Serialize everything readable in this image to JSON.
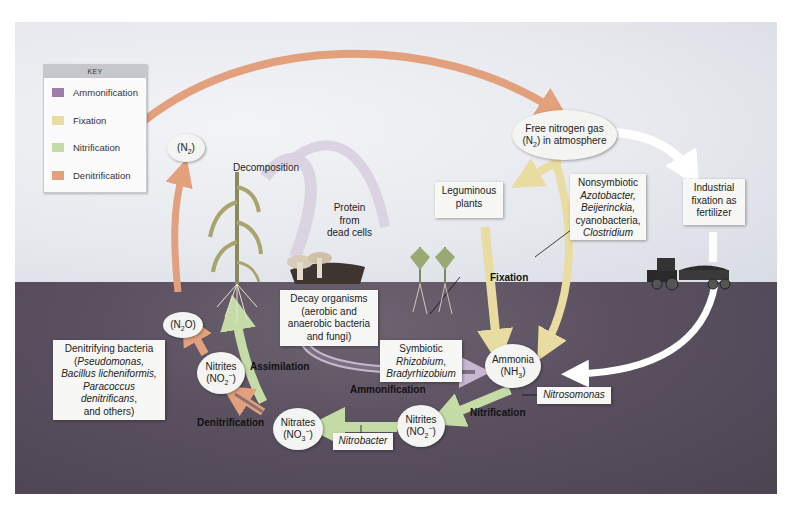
{
  "key": {
    "title": "KEY",
    "items": [
      {
        "label": "Ammonification",
        "color": "#9b7fa8"
      },
      {
        "label": "Fixation",
        "color": "#e8dca0"
      },
      {
        "label": "Nitrification",
        "color": "#c6dca6"
      },
      {
        "label": "Denitrification",
        "color": "#e2a07c"
      }
    ]
  },
  "colors": {
    "ammonification": "#9b7fa8",
    "fixation": "#e8dca0",
    "nitrification": "#c6dca6",
    "denitrification": "#e2a07c",
    "industrial": "#ffffff",
    "sky": "#e6e9ee",
    "soil": "#5a5060"
  },
  "nodes": {
    "n2_left": {
      "prefix": "(N",
      "sub": "2",
      "suffix": ")"
    },
    "n2o": {
      "prefix": "(N",
      "sub": "2",
      "suffix": "O)"
    },
    "free_n2": {
      "line1": "Free nitrogen gas",
      "line2_prefix": "(N",
      "line2_sub": "2",
      "line2_suffix": ") in atmosphere"
    },
    "ammonia": {
      "line1": "Ammonia",
      "line2_prefix": "(NH",
      "line2_sub": "3",
      "line2_suffix": ")"
    },
    "nitrites_upper": {
      "line1": "Nitrites",
      "line2_prefix": "(NO",
      "line2_sub": "2",
      "line2_sup": "−",
      "line2_suffix": ")"
    },
    "nitrites_lower": {
      "line1": "Nitrites",
      "line2_prefix": "(NO",
      "line2_sub": "2",
      "line2_sup": "−",
      "line2_suffix": ")"
    },
    "nitrates": {
      "line1": "Nitrates",
      "line2_prefix": "(NO",
      "line2_sub": "3",
      "line2_sup": "−",
      "line2_suffix": ")"
    }
  },
  "labels": {
    "decomposition": "Decomposition",
    "protein": [
      "Protein",
      "from",
      "dead cells"
    ],
    "leguminous": [
      "Leguminous",
      "plants"
    ],
    "nonsymbiotic": {
      "line1": "Nonsymbiotic",
      "line2": "Azotobacter,",
      "line3": "Beijerinckia,",
      "line4": "cyanobacteria,",
      "line5": "Clostridium"
    },
    "industrial": [
      "Industrial",
      "fixation as",
      "fertilizer"
    ],
    "decay": [
      "Decay organisms",
      "(aerobic and",
      "anaerobic bacteria",
      "and fungi)"
    ],
    "symbiotic": {
      "line1": "Symbiotic",
      "line2": "Rhizobium",
      "line2_comma": ",",
      "line3": "Bradyrhizobium"
    },
    "denitrifying": {
      "line1": "Denitrifying bacteria",
      "line2_open": "(",
      "line2": "Pseudomonas,",
      "line3": "Bacillus licheniformis,",
      "line4": "Paracoccus",
      "line5": "denitrificans",
      "line5_comma": ",",
      "line6": "and others)"
    },
    "nitrosomonas": "Nitrosomonas",
    "nitrobacter": "Nitrobacter"
  },
  "process_labels": {
    "fixation": "Fixation",
    "assimilation": "Assimilation",
    "ammonification": "Ammonification",
    "denitrification": "Denitrification",
    "nitrification": "Nitrification"
  }
}
